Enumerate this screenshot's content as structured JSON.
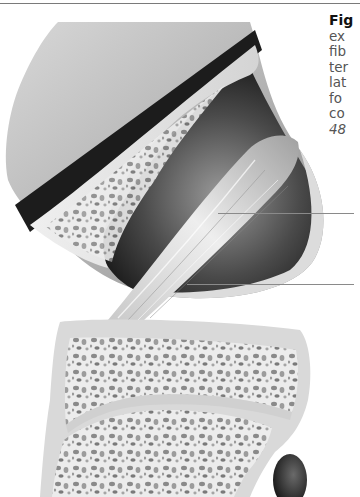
{
  "page": {
    "type": "textbook figure page (cropped)",
    "top_rule": true
  },
  "figure": {
    "parts": [
      {
        "name": "femur-condyle",
        "description": "upper bone with cut-away showing cancellous bone"
      },
      {
        "name": "ligament",
        "description": "fibrous ligament band running diagonally"
      },
      {
        "name": "tibia",
        "description": "lower bone block with cancellous bone and growth plate line"
      },
      {
        "name": "fibula-head",
        "description": "dark rounded structure at lower right"
      }
    ],
    "leader_lines": [
      {
        "id": "leader-1",
        "y": 213,
        "x_start": 218,
        "x_end": 354
      },
      {
        "id": "leader-2",
        "y": 284,
        "x_start": 187,
        "x_end": 354
      }
    ],
    "colors": {
      "bone_light": "#e6e6e6",
      "bone_mid": "#bdbdbd",
      "shadow": "#2a2a2a",
      "leader": "#8a8a8a",
      "caption_text": "#555555",
      "caption_label": "#111111"
    }
  },
  "caption": {
    "label": "Fig",
    "lines": [
      "ex",
      "fib",
      "ter",
      "lat",
      "fo",
      "co"
    ],
    "ref": "48"
  }
}
